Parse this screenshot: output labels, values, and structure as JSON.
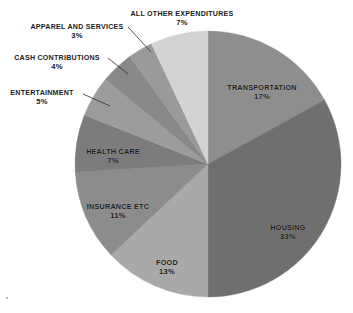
{
  "chart_data": {
    "type": "pie",
    "title": "",
    "subtitle": "",
    "xlabel": "",
    "ylabel": "",
    "legend_position": "none",
    "grid": false,
    "units": "%",
    "total": 100,
    "start_angle_deg": 0,
    "direction": "clockwise",
    "categories": [
      "Transportation",
      "Housing",
      "Food",
      "Insurance etc",
      "Health care",
      "Entertainment",
      "Cash contributions",
      "Apparel and services",
      "All other expenditures"
    ],
    "values": [
      17,
      33,
      13,
      11,
      7,
      5,
      4,
      3,
      7
    ],
    "slices": [
      {
        "name": "Transportation",
        "value": 17,
        "value_label": "17%",
        "color": "#8e8e8e",
        "label_placement": "inside",
        "label_x": 262,
        "label_y": 84
      },
      {
        "name": "Housing",
        "value": 33,
        "value_label": "33%",
        "color": "#6f6f6f",
        "label_placement": "inside",
        "label_x": 288,
        "label_y": 224
      },
      {
        "name": "Food",
        "value": 13,
        "value_label": "13%",
        "color": "#a9a9a9",
        "label_placement": "inside",
        "label_x": 167,
        "label_y": 259
      },
      {
        "name": "Insurance etc",
        "value": 11,
        "value_label": "11%",
        "color": "#8c8c8c",
        "label_placement": "inside",
        "label_x": 118,
        "label_y": 203
      },
      {
        "name": "Health care",
        "value": 7,
        "value_label": "7%",
        "color": "#7c7c7c",
        "label_placement": "inside",
        "label_x": 113,
        "label_y": 148
      },
      {
        "name": "Entertainment",
        "value": 5,
        "value_label": "5%",
        "color": "#9c9c9c",
        "label_placement": "outside",
        "label_x": 42,
        "label_y": 90,
        "leader": {
          "x1": 83,
          "y1": 94,
          "x2": 110,
          "y2": 106
        }
      },
      {
        "name": "Cash contributions",
        "value": 4,
        "value_label": "4%",
        "color": "#888888",
        "label_placement": "outside",
        "label_x": 57,
        "label_y": 55,
        "leader": {
          "x1": 108,
          "y1": 58,
          "x2": 128,
          "y2": 74
        }
      },
      {
        "name": "Apparel and services",
        "value": 3,
        "value_label": "3%",
        "color": "#9a9a9a",
        "label_placement": "outside",
        "label_x": 77,
        "label_y": 24,
        "leader": {
          "x1": 128,
          "y1": 27,
          "x2": 151,
          "y2": 52
        }
      },
      {
        "name": "All other expenditures",
        "value": 7,
        "value_label": "7%",
        "color": "#d3d3d3",
        "label_placement": "outside",
        "label_x": 182,
        "label_y": 11,
        "leader": null
      }
    ],
    "geometry": {
      "center_x": 208,
      "center_y": 164,
      "radius": 133
    },
    "background_color": "#ffffff",
    "text_color": "#1b1b1b"
  },
  "artifacts": {
    "corner_speck": "speck"
  }
}
